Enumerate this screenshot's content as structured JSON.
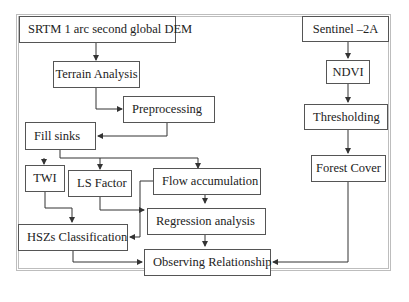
{
  "diagram": {
    "type": "flowchart",
    "nodes": {
      "srtm": "SRTM 1 arc second global DEM",
      "terrain": "Terrain Analysis",
      "preprocessing": "Preprocessing",
      "fill_sinks": "Fill sinks",
      "twi": "TWI",
      "ls_factor": "LS Factor",
      "flow_acc": "Flow accumulation",
      "regression": "Regression analysis",
      "hszs": "HSZs Classification",
      "observing": "Observing Relationship",
      "sentinel": "Sentinel –2A",
      "ndvi": "NDVI",
      "thresholding": "Thresholding",
      "forest_cover": "Forest Cover"
    },
    "edges": [
      [
        "SRTM 1 arc second global DEM",
        "Terrain Analysis"
      ],
      [
        "Terrain Analysis",
        "Preprocessing"
      ],
      [
        "Preprocessing",
        "Fill sinks"
      ],
      [
        "Fill sinks",
        "TWI"
      ],
      [
        "Fill sinks",
        "LS Factor"
      ],
      [
        "Fill sinks",
        "Flow accumulation"
      ],
      [
        "TWI",
        "HSZs Classification"
      ],
      [
        "LS Factor",
        "HSZs Classification"
      ],
      [
        "LS Factor",
        "Regression analysis"
      ],
      [
        "Flow accumulation",
        "Regression analysis"
      ],
      [
        "Flow accumulation",
        "HSZs Classification"
      ],
      [
        "Regression analysis",
        "Observing Relationship"
      ],
      [
        "HSZs Classification",
        "Observing Relationship"
      ],
      [
        "Sentinel –2A",
        "NDVI"
      ],
      [
        "NDVI",
        "Thresholding"
      ],
      [
        "Thresholding",
        "Forest Cover"
      ],
      [
        "Forest Cover",
        "Observing Relationship"
      ]
    ],
    "colors": {
      "line": "#333333",
      "box_border": "#555555",
      "frame": "#bdbdbd"
    }
  }
}
